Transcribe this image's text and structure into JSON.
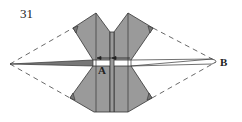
{
  "diagram": {
    "step_number": "31",
    "labels": {
      "point_a": "A",
      "point_b": "B"
    },
    "colors": {
      "paper_fill": "#9a9a9a",
      "line": "#333333",
      "background": "#ffffff"
    }
  }
}
